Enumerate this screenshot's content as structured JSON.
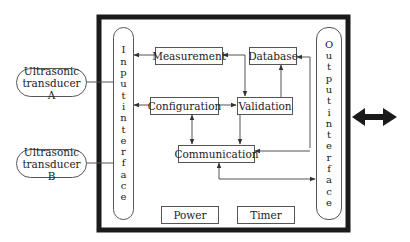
{
  "diagram": {
    "title": "",
    "external": [
      {
        "id": "transducer_a",
        "line1": "Ultrasonic",
        "line2": "transducer A"
      },
      {
        "id": "transducer_b",
        "line1": "Ultrasonic",
        "line2": "transducer B"
      }
    ],
    "input_interface": {
      "label": "Input interface",
      "letters": [
        "I",
        "n",
        "p",
        "u",
        "t",
        "i",
        "n",
        "t",
        "e",
        "r",
        "f",
        "a",
        "c",
        "e"
      ]
    },
    "output_interface": {
      "label": "Output interface",
      "letters": [
        "O",
        "u",
        "t",
        "p",
        "u",
        "t",
        "i",
        "n",
        "t",
        "e",
        "r",
        "f",
        "a",
        "c",
        "e"
      ]
    },
    "blocks": {
      "measurement": "Measurement",
      "database": "Database",
      "configuration": "Configuration",
      "validation": "Validation",
      "communication": "Communication",
      "power": "Power",
      "timer": "Timer"
    },
    "connections": [
      {
        "from": "Measurement",
        "to": "Input interface",
        "type": "arrow"
      },
      {
        "from": "Configuration",
        "to": "Input interface",
        "type": "arrow"
      },
      {
        "from": "Configuration",
        "to": "Validation",
        "type": "arrow"
      },
      {
        "from": "Measurement",
        "to": "Validation",
        "type": "bidirectional"
      },
      {
        "from": "Validation",
        "to": "Database",
        "type": "arrow"
      },
      {
        "from": "Output interface",
        "to": "Database",
        "type": "arrow"
      },
      {
        "from": "Output interface",
        "to": "Communication",
        "type": "arrow"
      },
      {
        "from": "Validation",
        "to": "Communication",
        "type": "arrow"
      },
      {
        "from": "Configuration",
        "to": "Communication",
        "type": "bidirectional"
      },
      {
        "from": "Communication",
        "to": "Output interface",
        "type": "arrow"
      },
      {
        "from": "Ultrasonic transducer A",
        "to": "Input interface",
        "type": "line"
      },
      {
        "from": "Ultrasonic transducer B",
        "to": "Input interface",
        "type": "line"
      },
      {
        "from": "System",
        "to": "External",
        "type": "bidirectional-bold"
      }
    ],
    "colors": {
      "stroke": "#555555",
      "frame": "#1a1a1a",
      "background": "#ffffff"
    }
  }
}
